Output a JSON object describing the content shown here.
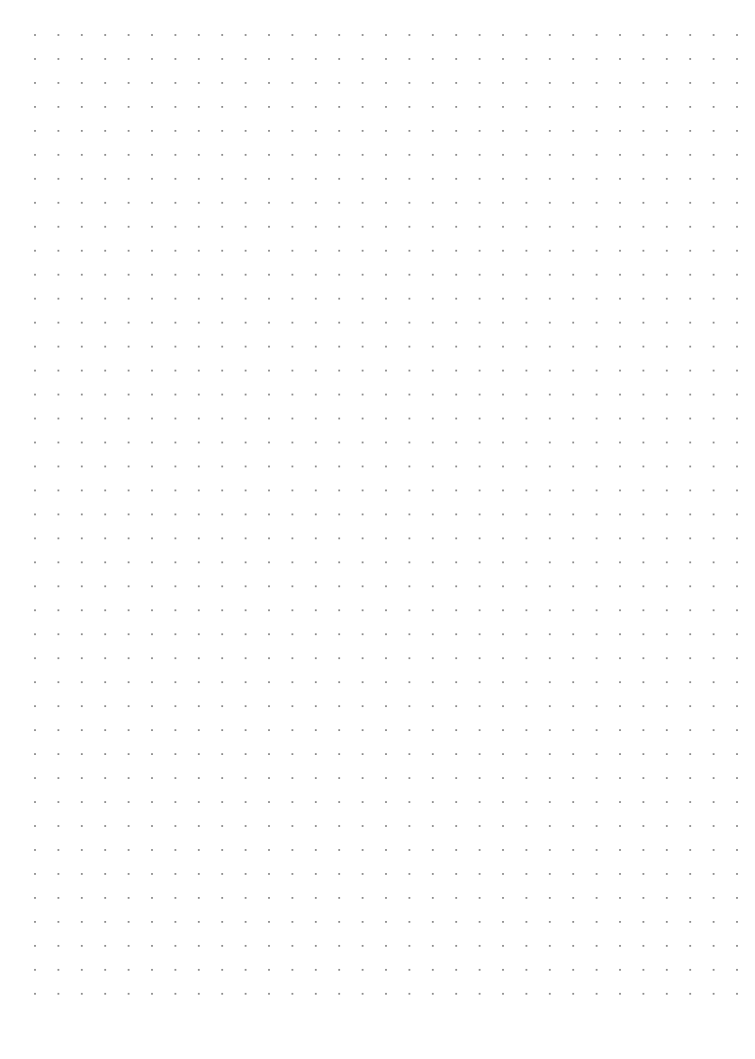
{
  "page": {
    "type": "dot-grid-paper",
    "background_color": "#ffffff",
    "width": 755,
    "height": 1059
  },
  "dot_grid": {
    "dot_color": "#8a8a8a",
    "dot_size": 1.8,
    "columns": 31,
    "rows": 41,
    "origin_x": 35,
    "origin_y": 35,
    "step_x": 23.4,
    "step_y": 23.97
  }
}
